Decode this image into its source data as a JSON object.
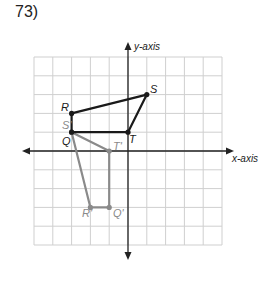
{
  "problem": {
    "number": "73)"
  },
  "axes": {
    "x_label": "x-axis",
    "y_label": "y-axis",
    "range": {
      "xmin": -5,
      "xmax": 5,
      "ymin": -5,
      "ymax": 5
    }
  },
  "colors": {
    "original": "#1a1a1a",
    "image": "#8a8a8a",
    "grid": "#cfcfcf",
    "axis": "#222222"
  },
  "figures": {
    "original": {
      "name": "QRST",
      "vertices": [
        {
          "label": "R",
          "x": -3,
          "y": 2
        },
        {
          "label": "S",
          "x": 1,
          "y": 3
        },
        {
          "label": "T",
          "x": 0,
          "y": 1
        },
        {
          "label": "Q",
          "x": -3,
          "y": 1
        }
      ]
    },
    "image": {
      "name": "Q'R'S'T'",
      "vertices": [
        {
          "label": "S'",
          "x": -3,
          "y": 1
        },
        {
          "label": "T'",
          "x": -1,
          "y": 0
        },
        {
          "label": "Q'",
          "x": -1,
          "y": -3
        },
        {
          "label": "R'",
          "x": -2,
          "y": -3
        }
      ]
    }
  },
  "labels": {
    "R": "R",
    "S": "S",
    "T": "T",
    "Q": "Q",
    "S_prime": "S'",
    "T_prime": "T'",
    "Q_prime": "Q'",
    "R_prime": "R'"
  }
}
